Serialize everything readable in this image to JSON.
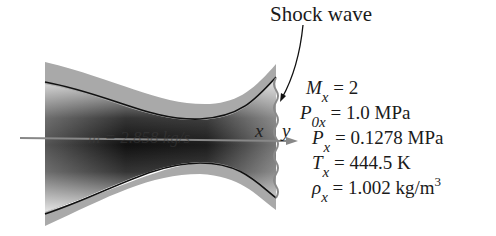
{
  "diagram": {
    "shock_label": "Shock wave",
    "mass_flow": "ṁ = 2.858 kg/s",
    "upstream_label": "x",
    "downstream_label": "y",
    "properties": [
      {
        "symbol": "M",
        "sub": "x",
        "value": "= 2",
        "sup": ""
      },
      {
        "symbol": "P",
        "sub": "0x",
        "value": "= 1.0 MPa",
        "sup": ""
      },
      {
        "symbol": "P",
        "sub": "x",
        "value": "= 0.1278 MPa",
        "sup": ""
      },
      {
        "symbol": "T",
        "sub": "x",
        "value": "= 444.5 K",
        "sup": ""
      },
      {
        "symbol": "ρ",
        "sub": "x",
        "value": "= 1.002 kg/m",
        "sup": "3"
      }
    ],
    "colors": {
      "wall": "#a8a8a8",
      "wall_line": "#111111",
      "flow_dark": "#111111",
      "arrow": "#888888",
      "text": "#1a1a1a"
    }
  }
}
